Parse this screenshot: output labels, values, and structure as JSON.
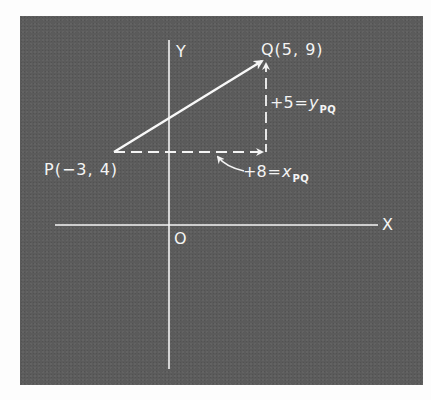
{
  "diagram": {
    "colors": {
      "panel": "#5b5b5b",
      "ink": "#f4f4f4",
      "page": "#fdfdfd"
    },
    "axes": {
      "x_label": "X",
      "y_label": "Y",
      "origin_label": "O"
    },
    "points": {
      "P": {
        "label": "P(−3, 4)",
        "x": -3,
        "y": 4
      },
      "Q": {
        "label": "Q(5, 9)",
        "x": 5,
        "y": 9
      }
    },
    "components": {
      "y": {
        "value": "+5",
        "eq": "=",
        "var": "y",
        "sub": "PQ"
      },
      "x": {
        "value": "+8",
        "eq": "=",
        "var": "x",
        "sub": "PQ"
      }
    },
    "elements": {
      "vector": "arrow from P to Q (solid)",
      "x_component": "dashed horizontal arrow from P rightward",
      "y_component": "dashed vertical arrow upward to Q",
      "pointer": "curved arrow pointing at x-component"
    }
  }
}
